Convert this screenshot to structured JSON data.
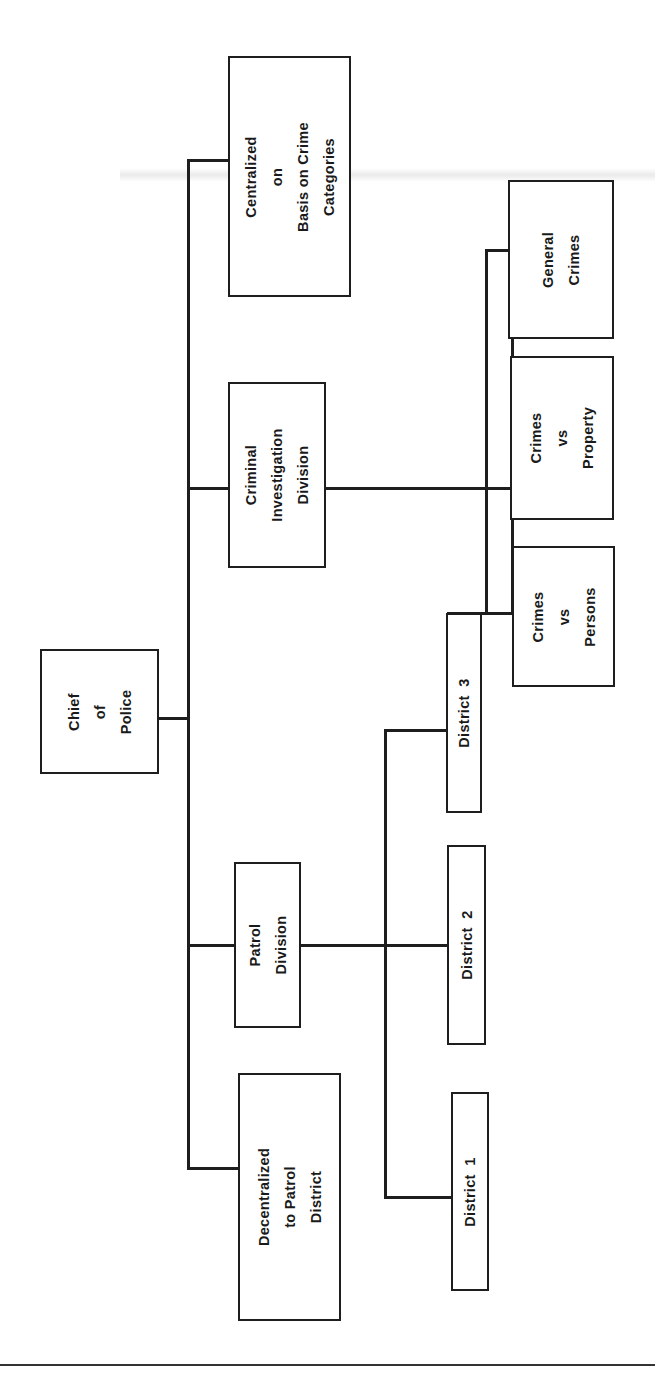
{
  "diagram": {
    "type": "org-chart",
    "orientation": "rotated-90-ccw",
    "line_color": "#1e1e1e",
    "background": "#ffffff",
    "nodes": {
      "chief": {
        "label": "Chief\nof\nPolice"
      },
      "centralized": {
        "label": "Centralized\non\nBasis on Crime\nCategories"
      },
      "cid": {
        "label": "Criminal\nInvestigation\nDivision"
      },
      "patrol": {
        "label": "Patrol\nDivision"
      },
      "decentralized": {
        "label": "Decentralized\nto Patrol\nDistrict"
      },
      "general_crimes": {
        "label": "General\nCrimes"
      },
      "crimes_property": {
        "label": "Crimes\nvs\nProperty"
      },
      "crimes_persons": {
        "label": "Crimes\nvs\nPersons"
      },
      "district3": {
        "label": "District  3"
      },
      "district2": {
        "label": "District  2"
      },
      "district1": {
        "label": "District  1"
      }
    },
    "edges": [
      [
        "chief",
        "centralized"
      ],
      [
        "chief",
        "cid"
      ],
      [
        "chief",
        "patrol"
      ],
      [
        "chief",
        "decentralized"
      ],
      [
        "cid",
        "general_crimes"
      ],
      [
        "cid",
        "crimes_property"
      ],
      [
        "cid",
        "crimes_persons"
      ],
      [
        "cid",
        "district3"
      ],
      [
        "patrol",
        "district3"
      ],
      [
        "patrol",
        "district2"
      ],
      [
        "patrol",
        "district1"
      ]
    ]
  }
}
